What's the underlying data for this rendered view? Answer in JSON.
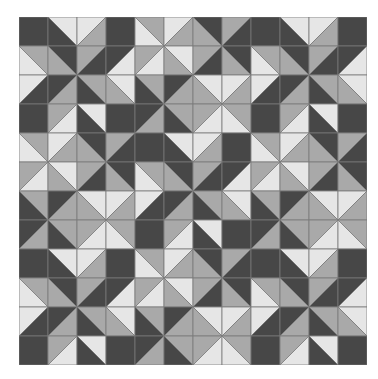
{
  "quilt": {
    "title": "Half-square triangle quilt pattern",
    "grid_size": 12,
    "cell_px": 29,
    "colors": {
      "D": "#474747",
      "M": "#a9a9a9",
      "L": "#e6e6e6",
      "line": "#7a7a7a",
      "background": "#ffffff"
    },
    "block_layout": [
      [
        "A",
        "B",
        "A"
      ],
      [
        "B",
        "A",
        "B"
      ],
      [
        "A",
        "B",
        "A"
      ]
    ],
    "blocks": {
      "A": {
        "name": "star-block",
        "cells": [
          [
            "D",
            "\\:L:D",
            "/:L:M",
            "D"
          ],
          [
            "\\:M:L",
            "\\:D:M",
            "/:M:D",
            "/:D:L"
          ],
          [
            "/:L:D",
            "/:D:M",
            "\\:M:D",
            "\\:L:M"
          ],
          [
            "D",
            "/:M:L",
            "\\:L:D",
            "D"
          ]
        ]
      },
      "B": {
        "name": "pinwheel-block",
        "cells": [
          [
            "\\:M:L",
            "/:L:M",
            "\\:D:M",
            "/:M:D"
          ],
          [
            "/:M:L",
            "\\:L:M",
            "/:M:D",
            "\\:D:M"
          ],
          [
            "\\:M:D",
            "/:D:M",
            "\\:L:M",
            "/:L:M"
          ],
          [
            "/:D:M",
            "\\:M:D",
            "/:M:L",
            "\\:M:L"
          ]
        ]
      }
    },
    "cell_notation": "Solid color letter, or 'diag:first:second'. For '\\' first=upper-right, second=lower-left. For '/' first=upper-left, second=lower-right."
  }
}
